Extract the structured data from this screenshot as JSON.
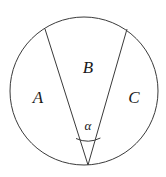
{
  "figure": {
    "background_color": "#ffffff",
    "stroke_color": "#3a3a3a",
    "text_color": "#1a1a1a",
    "stroke_width": 1,
    "circle": {
      "name": "circle-outline",
      "cx": 84,
      "cy": 91,
      "r": 74
    },
    "apex": {
      "name": "angle-vertex",
      "x": 88,
      "y": 165
    },
    "chords": [
      {
        "name": "left-chord",
        "x1": 45,
        "y1": 29,
        "x2": 88,
        "y2": 165
      },
      {
        "name": "right-chord",
        "x1": 127,
        "y1": 29,
        "x2": 88,
        "y2": 165
      }
    ],
    "angle_arc": {
      "name": "angle-arc",
      "path": "M 76.0 138.5 A 28 28 0 0 0 100.4 138.0"
    },
    "labels": [
      {
        "name": "region-label-a",
        "text": "A",
        "x": 38,
        "y": 97
      },
      {
        "name": "region-label-b",
        "text": "B",
        "x": 88,
        "y": 67
      },
      {
        "name": "region-label-c",
        "text": "C",
        "x": 134,
        "y": 97
      },
      {
        "name": "angle-label-alpha",
        "text": "α",
        "x": 88,
        "y": 125
      }
    ]
  }
}
